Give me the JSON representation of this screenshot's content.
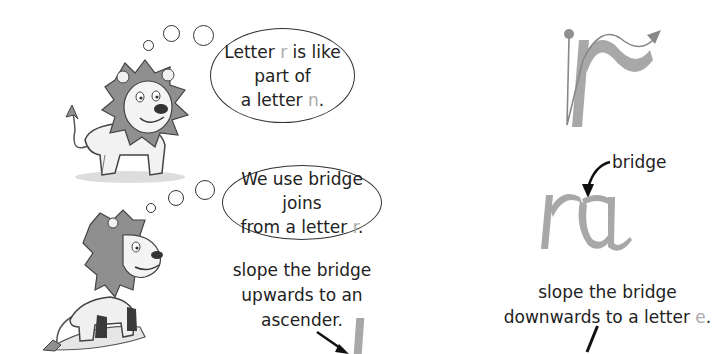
{
  "top_section": {
    "bubble": {
      "line1_prefix": "Letter ",
      "line1_letter": "r",
      "line1_suffix": " is like part of",
      "line2_prefix": "a letter ",
      "line2_letter": "n",
      "line2_suffix": "."
    },
    "illustration": "lion-smiling-standing",
    "letter_diagram": {
      "letter": "r",
      "description": "letter r stroke with start dot and direction arrow"
    }
  },
  "bottom_section": {
    "bubble": {
      "line1": "We use bridge joins",
      "line2_prefix": "from a letter ",
      "line2_letter": "r",
      "line2_suffix": "."
    },
    "illustration": "lion-on-rock",
    "upward_caption": {
      "line1": "slope the bridge",
      "line2": "upwards to an",
      "line3": "ascender."
    },
    "join_diagram": {
      "letters": "ra",
      "bridge_label": "bridge"
    },
    "downward_caption": {
      "line1": "slope the bridge",
      "line2_prefix": "downwards to a letter ",
      "line2_letter": "e",
      "line2_suffix": "."
    }
  },
  "colors": {
    "letter_grey": "#a8a8a8",
    "mane_grey": "#8f8f8f",
    "ink": "#222222"
  }
}
